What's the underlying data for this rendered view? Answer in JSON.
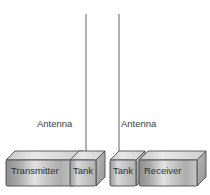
{
  "diagram": {
    "background_color": "#ffffff",
    "line_color": "#6e6e6e",
    "box_outline_color": "#4a4a4a",
    "text_color": "#3c3c3c",
    "antennas": [
      {
        "id": "antenna-left",
        "label": "Antenna",
        "x": 86,
        "y_top": 14,
        "y_bottom": 160
      },
      {
        "id": "antenna-right",
        "label": "Antenna",
        "x": 119,
        "y_top": 14,
        "y_bottom": 160
      }
    ],
    "boxes": [
      {
        "id": "transmitter",
        "label": "Transmitter",
        "front": {
          "x": 6,
          "y": 160,
          "w": 68,
          "h": 26
        },
        "depth": 9
      },
      {
        "id": "tank-left",
        "label": "Tank",
        "front": {
          "x": 70,
          "y": 160,
          "w": 26,
          "h": 26
        },
        "depth": 9
      },
      {
        "id": "tank-right",
        "label": "Tank",
        "front": {
          "x": 110,
          "y": 160,
          "w": 26,
          "h": 26
        },
        "depth": 9
      },
      {
        "id": "receiver",
        "label": "Receiver",
        "front": {
          "x": 139,
          "y": 160,
          "w": 58,
          "h": 26
        },
        "depth": 9
      }
    ]
  }
}
